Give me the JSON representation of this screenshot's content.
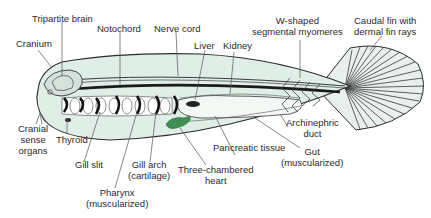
{
  "diagram": {
    "colors": {
      "body_fill": "#dfeee6",
      "outline": "#2b2b2b",
      "heart": "#3f8f56",
      "gut_fill": "#f4f8f5",
      "leader_line": "#555555"
    },
    "labels": {
      "tripartite_brain": [
        "Tripartite brain"
      ],
      "notochord": [
        "Notochord"
      ],
      "nerve_cord": [
        "Nerve cord"
      ],
      "cranium": [
        "Cranium"
      ],
      "liver": [
        "Liver"
      ],
      "kidney": [
        "Kidney"
      ],
      "myomeres": [
        "W-shaped",
        "segmental myomeres"
      ],
      "caudal_fin": [
        "Caudal fin with",
        "dermal fin rays"
      ],
      "cranial_sense_organs": [
        "Cranial",
        "sense",
        "organs"
      ],
      "thyroid": [
        "Thyroid"
      ],
      "gill_slit": [
        "Gill slit"
      ],
      "gill_arch": [
        "Gill arch",
        "(cartilage)"
      ],
      "pharynx": [
        "Pharynx",
        "(muscularized)"
      ],
      "heart": [
        "Three-chambered",
        "heart"
      ],
      "pancreatic_tissue": [
        "Pancreatic tissue"
      ],
      "archinephric_duct": [
        "Archinephric",
        "duct"
      ],
      "gut": [
        "Gut",
        "(muscularized)"
      ]
    }
  }
}
